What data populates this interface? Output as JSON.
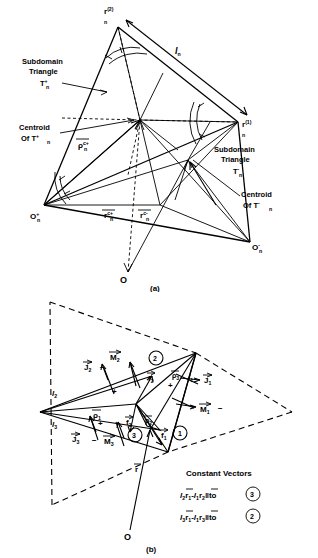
{
  "figure": {
    "caption_a": "(a)",
    "caption_b": "(b)"
  },
  "panel_a": {
    "vertex_top_label": "r",
    "vertex_top_sup": "(2)",
    "vertex_top_sub": "n",
    "vertex_right_label": "r",
    "vertex_right_sup": "(1)",
    "vertex_right_sub": "n",
    "edge_label": "l",
    "edge_sub": "n",
    "subdomain_plus_line1": "Subdomain",
    "subdomain_plus_line2": "Triangle",
    "subdomain_plus_line3": "T",
    "subdomain_plus_sup": "+",
    "subdomain_plus_sub": "n",
    "centroid_plus_line1": "Centroid",
    "centroid_plus_line2": "Of  T",
    "centroid_plus_sup": "+",
    "centroid_plus_sub": "n",
    "subdomain_minus_line1": "Subdomain",
    "subdomain_minus_line2": "Triangle",
    "subdomain_minus_line3": "T",
    "subdomain_minus_sup": "-",
    "subdomain_minus_sub": "n",
    "centroid_minus_line1": "Centroid",
    "centroid_minus_line2": "Of  T",
    "centroid_minus_sup": "-",
    "centroid_minus_sub": "n",
    "origin_plus": "O",
    "origin_plus_sup": "+",
    "origin_plus_sub": "n",
    "origin_minus": "O",
    "origin_minus_sup": "-",
    "origin_minus_sub": "n",
    "rho_c_plus": "ρ",
    "rho_c_plus_sup": "c+",
    "rho_c_plus_sub": "n",
    "r_c_plus": "r",
    "r_c_plus_sup": "c+",
    "r_c_plus_sub": "n",
    "r_c_minus": "r",
    "r_c_minus_sup": "c-",
    "r_c_minus_sub": "n",
    "global_origin": "O"
  },
  "panel_b": {
    "edge_l1": "l",
    "edge_l1_sub": "1",
    "edge_l2": "l",
    "edge_l2_sub": "2",
    "edge_l3": "l",
    "edge_l3_sub": "3",
    "J1": "J",
    "J1_sub": "1",
    "J2": "J",
    "J2_sub": "2",
    "J3": "J",
    "J3_sub": "3",
    "M1": "M",
    "M1_sub": "1",
    "M2": "M",
    "M2_sub": "2",
    "M3": "M",
    "M3_sub": "3",
    "f1": "f",
    "f1_sub": "1",
    "f2": "f",
    "f2_sub": "2",
    "f3": "f",
    "f3_sub": "3",
    "rho1": "ρ",
    "rho1_sub": "1",
    "rho2": "ρ",
    "rho2_sub": "2",
    "rho3": "ρ",
    "rho3_sub": "3",
    "r_vec": "r",
    "origin": "O",
    "circle1": "1",
    "circle2": "2",
    "circle3": "3",
    "sign_plus": "+",
    "sign_minus": "−",
    "constant_vectors_title": "Constant  Vectors",
    "formula1": {
      "l_a": "l",
      "l_a_sub": "2",
      "r_a": "r",
      "r_a_sub": "1",
      "minus": "-",
      "l_b": "l",
      "l_b_sub": "1",
      "r_b": "r",
      "r_b_sub": "2",
      "parallel": "‖",
      "to": "to",
      "target": "3"
    },
    "formula2": {
      "l_a": "l",
      "l_a_sub": "3",
      "r_a": "r",
      "r_a_sub": "1",
      "minus": "-",
      "l_b": "l",
      "l_b_sub": "1",
      "r_b": "r",
      "r_b_sub": "3",
      "parallel": "‖",
      "to": "to",
      "target": "2"
    }
  },
  "colors": {
    "ink": "#000000",
    "background": "#ffffff"
  }
}
